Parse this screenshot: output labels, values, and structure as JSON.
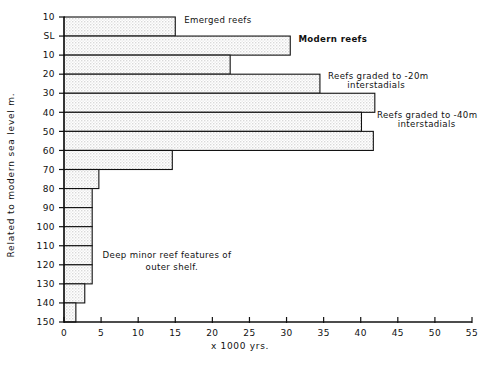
{
  "chart_data": {
    "type": "bar",
    "orientation": "horizontal",
    "title": "",
    "xlabel": "x 1000  yrs.",
    "ylabel": "Related to modern sea level m.",
    "xlim": [
      0,
      55
    ],
    "ylim_labels": [
      "10",
      "SL",
      "10",
      "20",
      "30",
      "40",
      "50",
      "60",
      "70",
      "80",
      "90",
      "100",
      "110",
      "120",
      "130",
      "140",
      "150"
    ],
    "xticks": [
      0,
      5,
      10,
      15,
      20,
      25,
      30,
      35,
      40,
      45,
      50,
      55
    ],
    "xticklabels": [
      "0",
      "5",
      "10",
      "15",
      "20",
      "25",
      "30",
      "35",
      "40",
      "45",
      "50",
      "55"
    ],
    "yticks": [
      -10,
      0,
      10,
      20,
      30,
      40,
      50,
      60,
      70,
      80,
      90,
      100,
      110,
      120,
      130,
      140,
      150
    ],
    "yticklabels": [
      "10",
      "SL",
      "10",
      "20",
      "30",
      "40",
      "50",
      "60",
      "70",
      "80",
      "90",
      "100",
      "110",
      "120",
      "130",
      "140",
      "150"
    ],
    "grid": false,
    "legend": "none",
    "categories": [
      "10 to SL",
      "SL to 10",
      "10 to 20",
      "20 to 30",
      "30 to 40",
      "40 to 50",
      "50 to 60",
      "60 to 70",
      "70 to 80",
      "80 to 90",
      "90 to 100",
      "100 to 110",
      "110 to 120",
      "120 to 130",
      "130 to 140",
      "140 to 150"
    ],
    "values": [
      15.0,
      30.5,
      22.4,
      34.5,
      41.9,
      40.1,
      41.7,
      14.6,
      4.7,
      3.8,
      3.8,
      3.8,
      3.8,
      3.8,
      2.8,
      1.6
    ],
    "bar_depth_top": [
      -10,
      0,
      10,
      20,
      30,
      40,
      50,
      60,
      70,
      80,
      90,
      100,
      110,
      120,
      130,
      140
    ],
    "bar_depth_bottom": [
      0,
      10,
      20,
      30,
      40,
      50,
      60,
      70,
      80,
      90,
      100,
      110,
      120,
      130,
      140,
      150
    ],
    "annotations": [
      {
        "id": "emerged-reefs",
        "text": "Emerged reefs",
        "bold": false,
        "x_units": 16.2,
        "y_depth": -7.0
      },
      {
        "id": "modern-reefs",
        "text": "Modern reefs",
        "bold": true,
        "x_units": 31.6,
        "y_depth": 3.0
      },
      {
        "id": "reefs-20m-line1",
        "text": "Reefs graded to -20m",
        "bold": false,
        "x_units": 35.6,
        "y_depth": 22.5
      },
      {
        "id": "reefs-20m-line2",
        "text": "interstadials",
        "bold": false,
        "x_units": 38.2,
        "y_depth": 27.0
      },
      {
        "id": "reefs-40m-line1",
        "text": "Reefs graded to -40m",
        "bold": false,
        "x_units": 42.2,
        "y_depth": 43.0
      },
      {
        "id": "reefs-40m-line2",
        "text": "interstadials",
        "bold": false,
        "x_units": 45.0,
        "y_depth": 47.5
      },
      {
        "id": "deep-minor-line1",
        "text": "Deep  minor  reef  features  of",
        "bold": false,
        "x_units": 5.2,
        "y_depth": 116.5
      },
      {
        "id": "deep-minor-line2",
        "text": "outer  shelf.",
        "bold": false,
        "x_units": 11.0,
        "y_depth": 122.5
      }
    ],
    "colors": {
      "axis": "#111111",
      "bar_stroke": "#111111",
      "bar_fill": "#e8e8e8",
      "background": "#ffffff"
    }
  }
}
